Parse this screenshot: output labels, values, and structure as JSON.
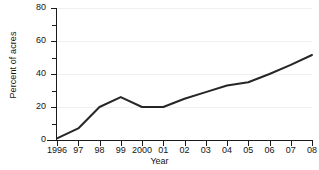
{
  "chart_data": {
    "type": "line",
    "title": "",
    "xlabel": "Year",
    "ylabel": "Percent of acres",
    "categories": [
      "1996",
      "97",
      "98",
      "99",
      "2000",
      "01",
      "02",
      "03",
      "04",
      "05",
      "06",
      "07",
      "08"
    ],
    "x": [
      1996,
      1997,
      1998,
      1999,
      2000,
      2001,
      2002,
      2003,
      2004,
      2005,
      2006,
      2007,
      2008
    ],
    "values": [
      1,
      7,
      20,
      26,
      20,
      20,
      25,
      29,
      33,
      35,
      40,
      45.5,
      51.5
    ],
    "series": [
      {
        "name": "Percent of acres",
        "values": [
          1,
          7,
          20,
          26,
          20,
          20,
          25,
          29,
          33,
          35,
          40,
          45.5,
          51.5
        ],
        "color": "#262626"
      }
    ],
    "xlim": [
      1996,
      2008
    ],
    "ylim": [
      0,
      80
    ],
    "yticks": [
      0,
      20,
      40,
      60,
      80
    ],
    "ytick_labels": [
      "0",
      "20",
      "40",
      "60",
      "80"
    ],
    "yticks_minor": [
      10,
      30,
      50,
      70
    ],
    "grid": true,
    "grid_axis": "y",
    "grid_color": "#efefef",
    "legend": false,
    "legend_position": "none",
    "line_width": 2,
    "background": "#ffffff",
    "axis_color": "#1b1b1b"
  }
}
